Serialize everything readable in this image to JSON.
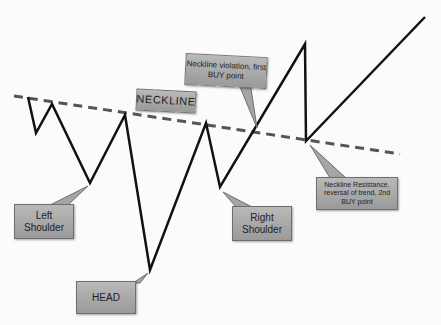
{
  "labels": {
    "neckline": "NECKLINE",
    "left_shoulder": "Left Shoulder",
    "head": "HEAD",
    "right_shoulder": "Right Shoulder",
    "first_buy": "Neckline violation, first BUY point",
    "second_buy": "Neckline Resistance, reversal of trend, 2nd BUY point"
  },
  "price_path": [
    [
      28,
      97
    ],
    [
      36,
      133
    ],
    [
      52,
      104
    ],
    [
      90,
      183
    ],
    [
      125,
      115
    ],
    [
      150,
      270
    ],
    [
      206,
      123
    ],
    [
      220,
      187
    ],
    [
      305,
      44
    ],
    [
      306,
      141
    ],
    [
      425,
      17
    ]
  ],
  "neckline": {
    "from": [
      14,
      96
    ],
    "to": [
      400,
      154
    ],
    "style": "dashed",
    "color": "#555555"
  },
  "colors": {
    "line": "#111111",
    "callout_fill": "#aaaaaa",
    "callout_border": "#6e6e6e"
  }
}
